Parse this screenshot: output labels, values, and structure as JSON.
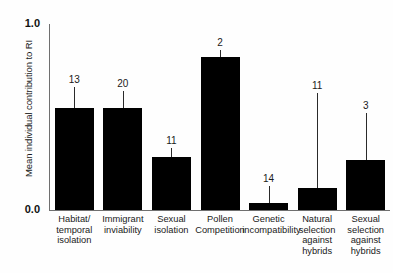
{
  "chart_data": {
    "type": "bar",
    "title": "",
    "xlabel": "",
    "ylabel": "Mean individual contribution to RI",
    "ylim": [
      0.0,
      1.0
    ],
    "ytick_labels": [
      "0.0",
      "1.0"
    ],
    "grid": false,
    "legend": null,
    "categories": [
      "Habitat/ temporal isolation",
      "Immigrant inviability",
      "Sexual isolation",
      "Pollen Competition",
      "Genetic incompatibility",
      "Natural selection against hybrids",
      "Sexual selection against hybrids"
    ],
    "category_lines": [
      [
        "Habitat/",
        "temporal",
        "isolation"
      ],
      [
        "Immigrant",
        "inviability"
      ],
      [
        "Sexual",
        "isolation"
      ],
      [
        "Pollen",
        "Competition"
      ],
      [
        "Genetic",
        "incompatibility"
      ],
      [
        "Natural",
        "selection",
        "against",
        "hybrids"
      ],
      [
        "Sexual",
        "selection",
        "against",
        "hybrids"
      ]
    ],
    "values": [
      0.55,
      0.55,
      0.285,
      0.82,
      0.04,
      0.12,
      0.27
    ],
    "error_upper": [
      0.66,
      0.64,
      0.335,
      0.86,
      0.13,
      0.63,
      0.52
    ],
    "sample_sizes": [
      13,
      20,
      11,
      2,
      14,
      11,
      3
    ],
    "bar_color": "#000000",
    "axis_color": "#6f6f6f",
    "annotation_note": "Numbers above error bars are sample sizes (n)"
  }
}
